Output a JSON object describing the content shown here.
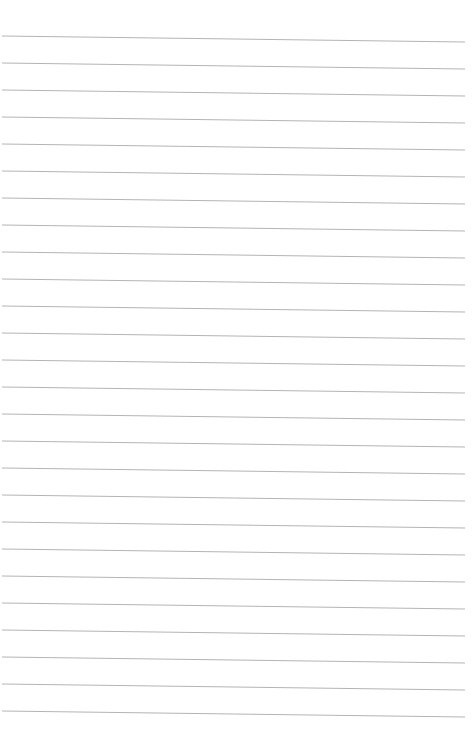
{
  "page": {
    "type": "lined-paper",
    "background": "#ffffff",
    "line_color": "#b4b4b4",
    "line_count": 26,
    "first_line_y_left": 36,
    "first_line_y_right": 42,
    "line_spacing": 27,
    "line_x_start": 2,
    "line_x_end": 465
  }
}
